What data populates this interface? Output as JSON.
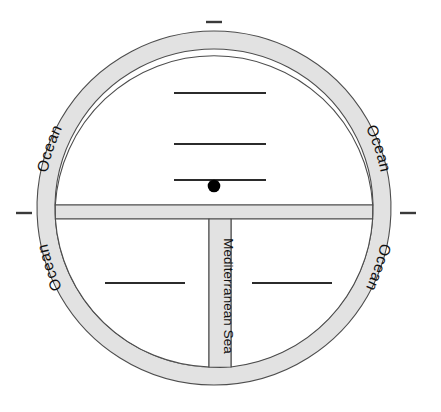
{
  "figure": {
    "type": "medieval-t-o-world-map",
    "canvas": {
      "width": 441,
      "height": 412
    }
  },
  "geometry": {
    "center_x": 214,
    "center_y": 208,
    "outer_radius": 177,
    "inner_radius": 159,
    "ring_thickness": 18,
    "crossbar_top_y": 205,
    "crossbar_bottom_y": 219,
    "stem_left_x": 209,
    "stem_right_x": 231
  },
  "colors": {
    "water_fill": "#e2e2e2",
    "land_fill": "#ffffff",
    "outline": "#4d4d4d",
    "rule_line": "#2b2b2b",
    "dot": "#000000",
    "page_background": "#ffffff"
  },
  "labels": {
    "ocean_top_left": "Ocean",
    "ocean_top_right": "Ocean",
    "ocean_bottom_left": "Ocean",
    "ocean_bottom_right": "Ocean",
    "mediterranean_sea": "Mediterranean Sea"
  },
  "blank_lines": [
    {
      "id": "top-line-1",
      "region": "upper-half",
      "x1": 174,
      "x2": 266,
      "y": 93
    },
    {
      "id": "top-line-2",
      "region": "upper-half",
      "x1": 174,
      "x2": 266,
      "y": 144
    },
    {
      "id": "top-line-3",
      "region": "upper-half",
      "x1": 174,
      "x2": 266,
      "y": 180
    },
    {
      "id": "bottom-left-line-1",
      "region": "lower-left-quadrant",
      "x1": 105,
      "x2": 185,
      "y": 283
    },
    {
      "id": "bottom-right-line-1",
      "region": "lower-right-quadrant",
      "x1": 252,
      "x2": 332,
      "y": 283
    }
  ],
  "markers": {
    "center_dot": {
      "x": 214,
      "y": 186,
      "radius": 6.3
    }
  },
  "tick_marks": [
    {
      "id": "tick-left",
      "x1": 16,
      "x2": 32,
      "y": 213
    },
    {
      "id": "tick-right",
      "x1": 400,
      "x2": 416,
      "y": 213
    },
    {
      "id": "tick-top",
      "x1": 206,
      "x2": 222,
      "y": 22
    }
  ]
}
